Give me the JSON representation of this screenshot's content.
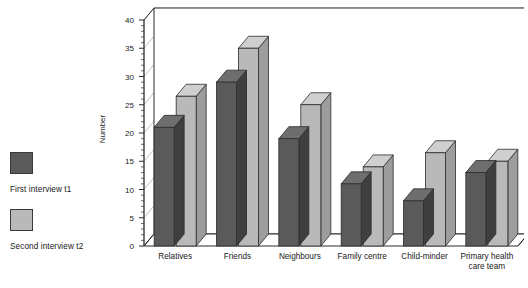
{
  "legend": {
    "entries": [
      {
        "label": "First interview t1",
        "color": "#5a5a5a",
        "swatch_name": "legend-swatch-first-interview"
      },
      {
        "label": "Second interview t2",
        "color": "#b9b9b9",
        "swatch_name": "legend-swatch-second-interview"
      }
    ]
  },
  "chart_data": {
    "type": "bar",
    "title": "",
    "subtitle": "",
    "xlabel": "",
    "ylabel": "Number",
    "ylim": [
      0,
      40
    ],
    "ytick_step": 5,
    "yticks": [
      "0",
      "5",
      "10",
      "15",
      "20",
      "25",
      "30",
      "35",
      "40"
    ],
    "grid": true,
    "legend_position": "left-outside",
    "style": "3d-column",
    "categories": [
      "Relatives",
      "Friends",
      "Neighbours",
      "Family centre",
      "Child-minder",
      "Primary health\ncare team"
    ],
    "series": [
      {
        "name": "First interview t1",
        "color": "#5a5a5a",
        "values": [
          21,
          29,
          19,
          11,
          8,
          13
        ]
      },
      {
        "name": "Second interview t2",
        "color": "#b9b9b9",
        "values": [
          26.5,
          35,
          25,
          14,
          16.5,
          15
        ]
      }
    ]
  },
  "colors": {
    "series1": "#5a5a5a",
    "series1_top": "#6e6e6e",
    "series1_side": "#3f3f3f",
    "series2": "#b9b9b9",
    "series2_top": "#cfcfcf",
    "series2_side": "#9d9d9d",
    "axis": "#2b2b2b",
    "grid": "#b0b0b0",
    "floor": "#ffffff",
    "background": "#ffffff"
  }
}
